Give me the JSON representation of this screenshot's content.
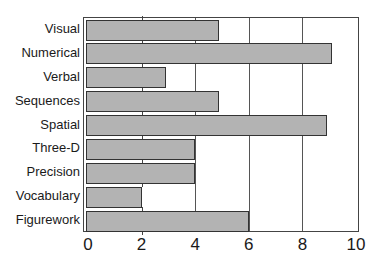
{
  "chart_data": {
    "type": "bar",
    "orientation": "horizontal",
    "title": "",
    "xlabel": "",
    "ylabel": "",
    "categories": [
      "Visual",
      "Numerical",
      "Verbal",
      "Sequences",
      "Spatial",
      "Three-D",
      "Precision",
      "Vocabulary",
      "Figurework"
    ],
    "values": [
      4.9,
      9.1,
      2.9,
      4.9,
      8.9,
      4,
      4,
      2,
      6
    ],
    "xlim": [
      0,
      10
    ],
    "xticks": [
      "0",
      "2",
      "4",
      "6",
      "8",
      "10"
    ],
    "grid": "vertical lines at 6 and 8 (and partial at 4)",
    "bar_color": "#b3b3b3",
    "legend": null
  }
}
